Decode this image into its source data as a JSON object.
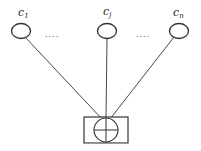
{
  "diagram": {
    "nodes": [
      {
        "id": "c1",
        "base": "c",
        "sub": "1",
        "cx": 21,
        "cy": 31
      },
      {
        "id": "cj",
        "base": "c",
        "sub": "j",
        "cx": 107,
        "cy": 31
      },
      {
        "id": "cn",
        "base": "c",
        "sub": "n",
        "cx": 179,
        "cy": 31
      }
    ],
    "ellipsis": [
      "....",
      "...."
    ],
    "combiner": {
      "symbol": "circle-plus",
      "x": 84,
      "y": 117,
      "w": 44,
      "h": 26,
      "cx": 106,
      "cy": 130,
      "r": 12
    },
    "colors": {
      "stroke": "#333333",
      "background": "#ffffff"
    }
  }
}
